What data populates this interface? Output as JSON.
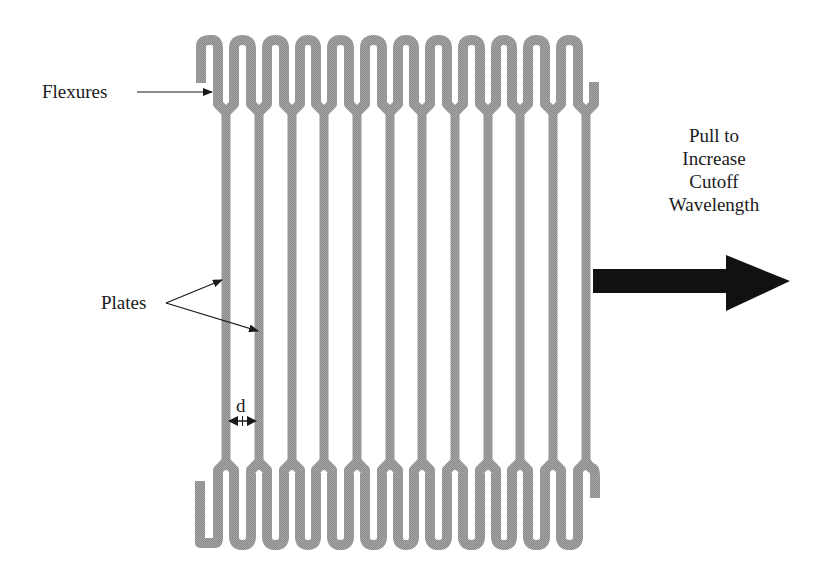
{
  "figure": {
    "type": "schematic",
    "labels": {
      "flexures": "Flexures",
      "plates": "Plates",
      "spacing": "d",
      "pull_lines": [
        "Pull to",
        "Increase",
        "Cutoff",
        "Wavelength"
      ]
    },
    "plate_count": 12,
    "colors": {
      "structure": "#9a9a9a",
      "arrow": "#111111",
      "text": "#1a1a1a",
      "background": "#ffffff"
    }
  }
}
